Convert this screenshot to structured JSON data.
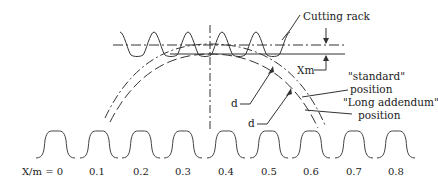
{
  "diagram": {
    "type": "gear profile shift diagram",
    "labels": {
      "cutting_rack": "Cutting rack",
      "xm": "Xm",
      "standard_line1": "\"standard\"",
      "standard_line2": "position",
      "long_line1": "\"Long addendum\"",
      "long_line2": "position",
      "d_upper": "d",
      "d_lower": "d"
    },
    "profile_shifts": [
      {
        "label": "X/m = 0",
        "value": 0
      },
      {
        "label": "0.1",
        "value": 0.1
      },
      {
        "label": "0.2",
        "value": 0.2
      },
      {
        "label": "0.3",
        "value": 0.3
      },
      {
        "label": "0.4",
        "value": 0.4
      },
      {
        "label": "0.5",
        "value": 0.5
      },
      {
        "label": "0.6",
        "value": 0.6
      },
      {
        "label": "0.7",
        "value": 0.7
      },
      {
        "label": "0.8",
        "value": 0.8
      }
    ],
    "colors": {
      "line": "#333333",
      "background": "#ffffff"
    }
  }
}
